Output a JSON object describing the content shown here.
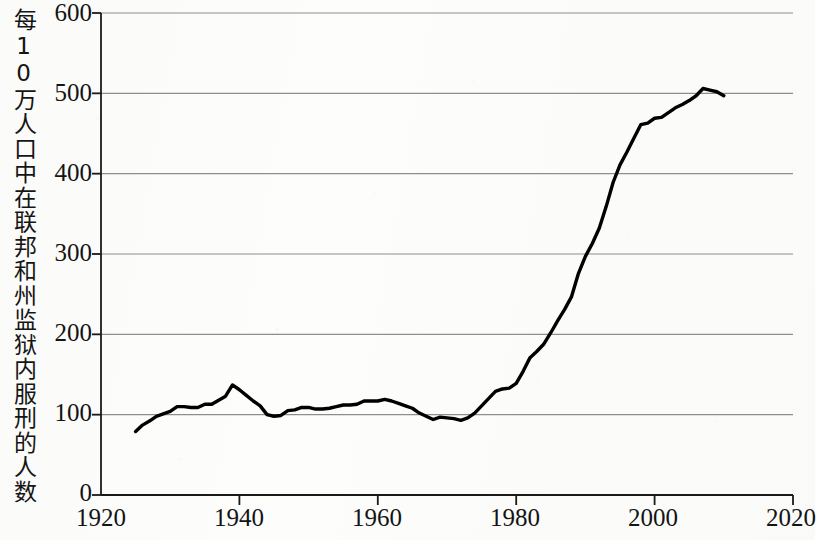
{
  "chart_data": {
    "type": "line",
    "title": "",
    "xlabel": "",
    "ylabel": "每10万人口中在联邦和州监狱内服刑的人数",
    "xlim": [
      1920,
      2020
    ],
    "ylim": [
      0,
      600
    ],
    "xticks": [
      1920,
      1940,
      1960,
      1980,
      2000,
      2020
    ],
    "yticks": [
      0,
      100,
      200,
      300,
      400,
      500,
      600
    ],
    "grid": "horizontal",
    "legend": "none",
    "line_color": "#000000",
    "series": [
      {
        "name": "每10万人口中在联邦和州监狱内服刑的人数",
        "x": [
          1925,
          1926,
          1927,
          1928,
          1929,
          1930,
          1931,
          1932,
          1933,
          1934,
          1935,
          1936,
          1937,
          1938,
          1939,
          1940,
          1941,
          1942,
          1943,
          1944,
          1945,
          1946,
          1947,
          1948,
          1949,
          1950,
          1951,
          1952,
          1953,
          1954,
          1955,
          1956,
          1957,
          1958,
          1959,
          1960,
          1961,
          1962,
          1963,
          1964,
          1965,
          1966,
          1967,
          1968,
          1969,
          1970,
          1971,
          1972,
          1973,
          1974,
          1975,
          1976,
          1977,
          1978,
          1979,
          1980,
          1981,
          1982,
          1983,
          1984,
          1985,
          1986,
          1987,
          1988,
          1989,
          1990,
          1991,
          1992,
          1993,
          1994,
          1995,
          1996,
          1997,
          1998,
          1999,
          2000,
          2001,
          2002,
          2003,
          2004,
          2005,
          2006,
          2007,
          2008,
          2009,
          2010
        ],
        "values": [
          79,
          87,
          92,
          98,
          101,
          104,
          110,
          110,
          109,
          109,
          113,
          113,
          118,
          123,
          137,
          131,
          124,
          117,
          111,
          100,
          98,
          99,
          105,
          106,
          109,
          109,
          107,
          107,
          108,
          110,
          112,
          112,
          113,
          117,
          117,
          117,
          119,
          117,
          114,
          111,
          108,
          102,
          98,
          94,
          97,
          96,
          95,
          93,
          96,
          102,
          111,
          120,
          129,
          132,
          133,
          139,
          154,
          171,
          179,
          188,
          202,
          217,
          231,
          247,
          276,
          297,
          313,
          332,
          359,
          389,
          411,
          427,
          444,
          461,
          463,
          469,
          470,
          476,
          482,
          486,
          491,
          497,
          506,
          504,
          502,
          497
        ]
      }
    ]
  },
  "axes": {
    "y_tick_labels": [
      "600",
      "500",
      "400",
      "300",
      "200",
      "100",
      "0"
    ],
    "x_tick_labels": [
      "1920",
      "1940",
      "1960",
      "1980",
      "2000",
      "2020"
    ],
    "y_axis_title": "每10万人口中在联邦和州监狱内服刑的人数"
  }
}
